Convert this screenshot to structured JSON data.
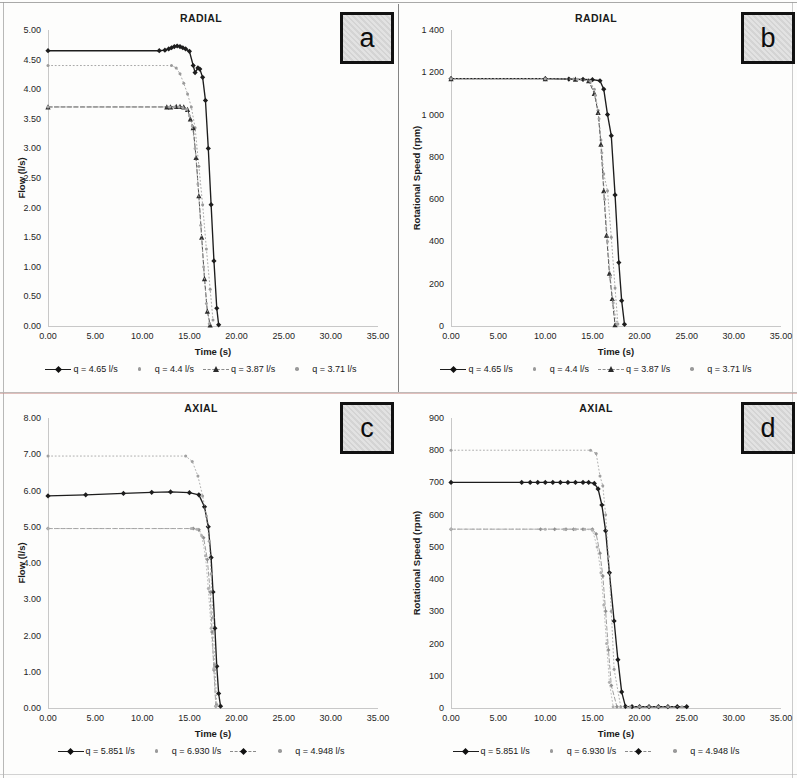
{
  "figure": {
    "panel_tags": [
      "a",
      "b",
      "c",
      "d"
    ],
    "background": "#fdfdfc",
    "accent": "#1d1d1d"
  },
  "panels": {
    "a": {
      "tag": "a",
      "title": "RADIAL",
      "xlabel": "Time (s)",
      "ylabel": "Flow (l/s)",
      "yticks": [
        "0.00",
        "0.50",
        "1.00",
        "1.50",
        "2.00",
        "2.50",
        "3.00",
        "3.50",
        "4.00",
        "4.50",
        "5.00"
      ],
      "xticks": [
        "0.00",
        "5.00",
        "10.00",
        "15.00",
        "20.00",
        "25.00",
        "30.00",
        "35.00"
      ],
      "legend": [
        {
          "label": "q = 4.65 l/s",
          "style": "solid",
          "marker": "diamond"
        },
        {
          "label": "q = 4.4 l/s",
          "style": "none",
          "marker": "dot"
        },
        {
          "label": "q = 3.87  l/s",
          "style": "dashed",
          "marker": "tri"
        },
        {
          "label": "q = 3.71 l/s",
          "style": "none",
          "marker": "dot"
        }
      ]
    },
    "b": {
      "tag": "b",
      "title": "RADIAL",
      "xlabel": "Time (s)",
      "ylabel": "Rotational Speed (rpm)",
      "yticks": [
        "0",
        "200",
        "400",
        "600",
        "800",
        "1 000",
        "1 200",
        "1 400"
      ],
      "xticks": [
        "0.00",
        "5.00",
        "10.00",
        "15.00",
        "20.00",
        "25.00",
        "30.00",
        "35.00"
      ],
      "legend": [
        {
          "label": "q = 4.65 l/s",
          "style": "solid",
          "marker": "diamond"
        },
        {
          "label": "q = 4.4 l/s",
          "style": "none",
          "marker": "dot"
        },
        {
          "label": "q = 3.87  l/s",
          "style": "dashed",
          "marker": "tri"
        },
        {
          "label": "q = 3.71 l/s",
          "style": "none",
          "marker": "dot"
        }
      ]
    },
    "c": {
      "tag": "c",
      "title": "AXIAL",
      "xlabel": "Time (s)",
      "ylabel": "Flow (l/s)",
      "yticks": [
        "0.00",
        "1.00",
        "2.00",
        "3.00",
        "4.00",
        "5.00",
        "6.00",
        "7.00",
        "8.00"
      ],
      "xticks": [
        "0.00",
        "5.00",
        "10.00",
        "15.00",
        "20.00",
        "25.00",
        "30.00",
        "35.00"
      ],
      "legend": [
        {
          "label": "q = 5.851 l/s",
          "style": "solid",
          "marker": "diamond"
        },
        {
          "label": "q = 6.930 l/s",
          "style": "none",
          "marker": "dot"
        },
        {
          "label": "",
          "style": "dashed",
          "marker": "diamond"
        },
        {
          "label": "q = 4.948 l/s",
          "style": "none",
          "marker": "dot"
        }
      ]
    },
    "d": {
      "tag": "d",
      "title": "AXIAL",
      "xlabel": "Time (s)",
      "ylabel": "Rotational Speed (rpm)",
      "yticks": [
        "0",
        "100",
        "200",
        "300",
        "400",
        "500",
        "600",
        "700",
        "800",
        "900"
      ],
      "xticks": [
        "0.00",
        "5.00",
        "10.00",
        "15.00",
        "20.00",
        "25.00",
        "30.00",
        "35.00"
      ],
      "legend": [
        {
          "label": "q = 5.851 l/s",
          "style": "solid",
          "marker": "diamond"
        },
        {
          "label": "q = 6.930 l/s",
          "style": "none",
          "marker": "dot"
        },
        {
          "label": "",
          "style": "dashed",
          "marker": "diamond"
        },
        {
          "label": "q = 4.948 l/s",
          "style": "none",
          "marker": "dot"
        }
      ]
    }
  },
  "chart_data": [
    {
      "id": "a",
      "type": "line",
      "title": "RADIAL",
      "xlabel": "Time (s)",
      "ylabel": "Flow (l/s)",
      "xlim": [
        0,
        35
      ],
      "ylim": [
        0,
        5
      ],
      "xticks": [
        0,
        5,
        10,
        15,
        20,
        25,
        30,
        35
      ],
      "yticks": [
        0,
        0.5,
        1,
        1.5,
        2,
        2.5,
        3,
        3.5,
        4,
        4.5,
        5
      ],
      "grid": false,
      "legend_position": "bottom",
      "series": [
        {
          "name": "q = 4.65 l/s",
          "style": "solid",
          "marker": "diamond",
          "color": "#1d1d1d",
          "x": [
            0.0,
            11.8,
            12.4,
            12.8,
            13.1,
            13.4,
            13.7,
            14.0,
            14.3,
            14.6,
            15.0,
            15.4,
            15.6,
            15.9,
            16.1,
            16.4,
            16.7,
            17.0,
            17.3,
            17.6,
            17.9,
            18.1
          ],
          "y": [
            4.65,
            4.65,
            4.66,
            4.68,
            4.7,
            4.72,
            4.73,
            4.72,
            4.7,
            4.68,
            4.64,
            4.4,
            4.28,
            4.36,
            4.34,
            4.2,
            3.81,
            3.0,
            2.05,
            1.1,
            0.3,
            0.02
          ]
        },
        {
          "name": "q = 4.4 l/s",
          "style": "none",
          "marker": "dot",
          "color": "#9a9a9a",
          "x": [
            0.0,
            13.1,
            13.6,
            14.0,
            14.4,
            14.8,
            15.2,
            15.6,
            16.0,
            16.4,
            16.8,
            17.2,
            17.5
          ],
          "y": [
            4.4,
            4.4,
            4.36,
            4.26,
            4.1,
            3.92,
            3.7,
            3.35,
            2.7,
            2.05,
            1.3,
            0.62,
            0.1
          ]
        },
        {
          "name": "q = 3.87  l/s",
          "style": "dashed",
          "marker": "tri",
          "color": "#2b2b2b",
          "x": [
            0.0,
            12.6,
            13.0,
            13.6,
            14.0,
            14.4,
            14.8,
            15.1,
            15.4,
            15.7,
            16.0,
            16.3,
            16.6,
            16.9,
            17.2
          ],
          "y": [
            3.7,
            3.7,
            3.7,
            3.71,
            3.71,
            3.7,
            3.66,
            3.5,
            3.35,
            2.85,
            2.2,
            1.5,
            0.8,
            0.25,
            0.02
          ]
        },
        {
          "name": "q = 3.71 l/s",
          "style": "none",
          "marker": "dot",
          "color": "#a5a5a5",
          "x": [
            0.0,
            12.9,
            13.4,
            13.9,
            14.3,
            14.7,
            15.0,
            15.3,
            15.6,
            15.9,
            16.2,
            16.5,
            16.8,
            17.1
          ],
          "y": [
            3.7,
            3.7,
            3.7,
            3.7,
            3.69,
            3.66,
            3.55,
            3.38,
            3.0,
            2.4,
            1.7,
            1.0,
            0.38,
            0.04
          ]
        }
      ]
    },
    {
      "id": "b",
      "type": "line",
      "title": "RADIAL",
      "xlabel": "Time (s)",
      "ylabel": "Rotational Speed (rpm)",
      "xlim": [
        0,
        35
      ],
      "ylim": [
        0,
        1400
      ],
      "xticks": [
        0,
        5,
        10,
        15,
        20,
        25,
        30,
        35
      ],
      "yticks": [
        0,
        200,
        400,
        600,
        800,
        1000,
        1200,
        1400
      ],
      "grid": false,
      "legend_position": "bottom",
      "series": [
        {
          "name": "q = 4.65 l/s",
          "style": "solid",
          "marker": "diamond",
          "color": "#1d1d1d",
          "x": [
            0.0,
            10.0,
            12.5,
            14.0,
            15.0,
            15.8,
            16.2,
            16.6,
            17.0,
            17.4,
            17.8,
            18.1,
            18.4
          ],
          "y": [
            1170,
            1170,
            1168,
            1166,
            1165,
            1160,
            1120,
            1000,
            900,
            620,
            300,
            120,
            8
          ]
        },
        {
          "name": "q = 4.4 l/s",
          "style": "none",
          "marker": "dot",
          "color": "#9a9a9a",
          "x": [
            0.0,
            10.0,
            13.0,
            14.6,
            15.2,
            15.6,
            15.9,
            16.2,
            16.6,
            17.0,
            17.4,
            17.7
          ],
          "y": [
            1170,
            1170,
            1168,
            1162,
            1120,
            1020,
            880,
            720,
            640,
            420,
            180,
            10
          ]
        },
        {
          "name": "q = 3.87  l/s",
          "style": "dashed",
          "marker": "tri",
          "color": "#2b2b2b",
          "x": [
            0.0,
            10.0,
            13.2,
            14.6,
            15.2,
            15.6,
            15.9,
            16.2,
            16.5,
            16.8,
            17.1,
            17.4
          ],
          "y": [
            1170,
            1170,
            1168,
            1160,
            1100,
            1010,
            860,
            640,
            430,
            250,
            130,
            6
          ]
        },
        {
          "name": "q = 3.71 l/s",
          "style": "none",
          "marker": "dot",
          "color": "#a5a5a5",
          "x": [
            0.0,
            10.0,
            13.4,
            14.8,
            15.3,
            15.7,
            16.0,
            16.3,
            16.6,
            16.9,
            17.2,
            17.6
          ],
          "y": [
            1170,
            1170,
            1167,
            1158,
            1090,
            980,
            820,
            600,
            400,
            230,
            110,
            8
          ]
        }
      ]
    },
    {
      "id": "c",
      "type": "line",
      "title": "AXIAL",
      "xlabel": "Time (s)",
      "ylabel": "Flow (l/s)",
      "xlim": [
        0,
        35
      ],
      "ylim": [
        0,
        8
      ],
      "xticks": [
        0,
        5,
        10,
        15,
        20,
        25,
        30,
        35
      ],
      "yticks": [
        0,
        1,
        2,
        3,
        4,
        5,
        6,
        7,
        8
      ],
      "grid": false,
      "legend_position": "bottom",
      "series": [
        {
          "name": "q = 5.851 l/s",
          "style": "solid",
          "marker": "diamond",
          "color": "#1d1d1d",
          "x": [
            0.0,
            4.0,
            8.0,
            11.0,
            13.0,
            15.0,
            16.0,
            16.6,
            17.0,
            17.3,
            17.5,
            17.7,
            17.9,
            18.1,
            18.3
          ],
          "y": [
            5.85,
            5.88,
            5.92,
            5.95,
            5.96,
            5.94,
            5.88,
            5.55,
            5.0,
            4.15,
            3.2,
            2.2,
            1.15,
            0.4,
            0.05
          ]
        },
        {
          "name": "q = 6.930 l/s",
          "style": "none",
          "marker": "dot",
          "color": "#a0a0a0",
          "x": [
            0.0,
            14.6,
            15.3,
            15.9,
            16.4,
            16.8,
            17.1,
            17.3,
            17.5,
            17.7,
            17.9
          ],
          "y": [
            6.95,
            6.95,
            6.8,
            6.4,
            5.85,
            5.3,
            4.6,
            3.7,
            2.5,
            1.2,
            0.1
          ]
        },
        {
          "name": "",
          "style": "dashed",
          "marker": "diamond",
          "color": "#8e8e8e",
          "x": [
            0.0,
            15.4,
            16.0,
            16.5,
            16.9,
            17.2,
            17.4,
            17.6,
            17.8
          ],
          "y": [
            4.95,
            4.95,
            4.92,
            4.7,
            4.1,
            3.2,
            2.1,
            1.05,
            0.05
          ]
        },
        {
          "name": "q = 4.948 l/s",
          "style": "none",
          "marker": "dot",
          "color": "#b0b0b0",
          "x": [
            0.0,
            15.2,
            15.8,
            16.3,
            16.7,
            17.0,
            17.3,
            17.6,
            17.8
          ],
          "y": [
            4.95,
            4.95,
            4.93,
            4.75,
            4.2,
            3.3,
            2.2,
            1.1,
            0.05
          ]
        }
      ]
    },
    {
      "id": "d",
      "type": "line",
      "title": "AXIAL",
      "xlabel": "Time (s)",
      "ylabel": "Rotational Speed (rpm)",
      "xlim": [
        0,
        35
      ],
      "ylim": [
        0,
        900
      ],
      "xticks": [
        0,
        5,
        10,
        15,
        20,
        25,
        30,
        35
      ],
      "yticks": [
        0,
        100,
        200,
        300,
        400,
        500,
        600,
        700,
        800,
        900
      ],
      "grid": false,
      "legend_position": "bottom",
      "series": [
        {
          "name": "q = 5.851 l/s",
          "style": "solid",
          "marker": "diamond",
          "color": "#1d1d1d",
          "x": [
            0.0,
            7.5,
            8.4,
            9.2,
            10.0,
            10.8,
            11.6,
            12.4,
            13.2,
            14.0,
            14.6,
            15.2,
            15.6,
            16.0,
            16.4,
            16.8,
            17.3,
            17.7,
            18.1,
            18.5,
            19.2,
            20.0,
            21.0,
            22.0,
            23.0,
            24.0,
            25.0
          ],
          "y": [
            700,
            700,
            700,
            700,
            700,
            700,
            700,
            700,
            700,
            700,
            700,
            697,
            680,
            630,
            550,
            420,
            270,
            150,
            50,
            5,
            4,
            4,
            4,
            4,
            4,
            4,
            4
          ]
        },
        {
          "name": "q = 6.930 l/s",
          "style": "none",
          "marker": "dot",
          "color": "#a0a0a0",
          "x": [
            0.0,
            14.8,
            15.4,
            15.8,
            16.1,
            16.4,
            16.7,
            17.0,
            17.3,
            18.0,
            19.0,
            20.0,
            21.0,
            22.0,
            23.0,
            24.5
          ],
          "y": [
            800,
            800,
            790,
            720,
            690,
            600,
            470,
            300,
            120,
            4,
            4,
            4,
            4,
            4,
            4,
            4
          ]
        },
        {
          "name": "",
          "style": "dashed",
          "marker": "diamond",
          "color": "#8e8e8e",
          "x": [
            0.0,
            9.5,
            11.0,
            12.2,
            13.0,
            14.0,
            15.0,
            15.4,
            15.8,
            16.1,
            16.4,
            16.7,
            17.0,
            17.6
          ],
          "y": [
            555,
            555,
            555,
            555,
            555,
            555,
            555,
            540,
            480,
            410,
            300,
            180,
            70,
            4
          ]
        },
        {
          "name": "q = 4.948 l/s",
          "style": "none",
          "marker": "dot",
          "color": "#b0b0b0",
          "x": [
            0.0,
            10.0,
            12.0,
            13.2,
            14.2,
            15.0,
            15.5,
            15.9,
            16.2,
            16.5,
            16.8,
            17.2
          ],
          "y": [
            555,
            555,
            555,
            555,
            555,
            552,
            500,
            420,
            320,
            200,
            80,
            4
          ]
        }
      ]
    }
  ]
}
